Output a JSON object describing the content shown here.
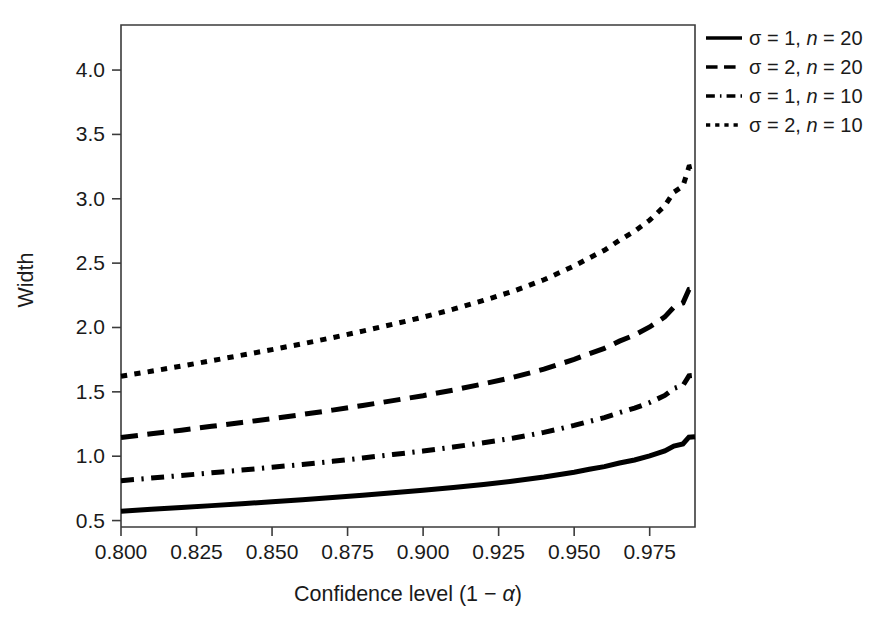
{
  "chart_data": {
    "type": "line",
    "title": "",
    "subtitle": "",
    "xlabel_parts": {
      "pre": "Confidence level (1 ",
      "minus": "−",
      "alpha": "α",
      "post": ")"
    },
    "xlabel": "Confidence level (1 − α)",
    "ylabel": "Width",
    "xlim": [
      0.8,
      0.99
    ],
    "ylim": [
      0.45,
      4.35
    ],
    "grid": false,
    "legend_position": "outside-top-right",
    "xticks": [
      0.8,
      0.825,
      0.85,
      0.875,
      0.9,
      0.925,
      0.95,
      0.975
    ],
    "xticklabels": [
      "0.800",
      "0.825",
      "0.850",
      "0.875",
      "0.900",
      "0.925",
      "0.950",
      "0.975"
    ],
    "yticks": [
      0.5,
      1.0,
      1.5,
      2.0,
      2.5,
      3.0,
      3.5,
      4.0
    ],
    "yticklabels": [
      "0.5",
      "1.0",
      "1.5",
      "2.0",
      "2.5",
      "3.0",
      "3.5",
      "4.0"
    ],
    "x": [
      0.8,
      0.81,
      0.82,
      0.83,
      0.84,
      0.85,
      0.86,
      0.87,
      0.88,
      0.89,
      0.9,
      0.91,
      0.92,
      0.93,
      0.94,
      0.95,
      0.955,
      0.96,
      0.965,
      0.97,
      0.975,
      0.98,
      0.983,
      0.986,
      0.988,
      0.99
    ],
    "series": [
      {
        "name": "σ = 1, n = 20",
        "sigma": 1,
        "n": 20,
        "dash": "solid",
        "color": "#000000",
        "linewidth": 5.0,
        "values": [
          0.573,
          0.587,
          0.601,
          0.616,
          0.631,
          0.646,
          0.662,
          0.679,
          0.697,
          0.716,
          0.735,
          0.757,
          0.781,
          0.807,
          0.838,
          0.876,
          0.898,
          0.919,
          0.947,
          0.971,
          1.002,
          1.041,
          1.079,
          1.095,
          1.148,
          1.152
        ]
      },
      {
        "name": "σ = 2, n = 20",
        "sigma": 2,
        "n": 20,
        "dash": "dashed",
        "color": "#000000",
        "linewidth": 5.0,
        "values": [
          1.146,
          1.174,
          1.202,
          1.232,
          1.262,
          1.292,
          1.324,
          1.358,
          1.394,
          1.432,
          1.47,
          1.514,
          1.562,
          1.614,
          1.676,
          1.752,
          1.796,
          1.838,
          1.894,
          1.942,
          2.004,
          2.082,
          2.158,
          2.19,
          2.296,
          2.304
        ]
      },
      {
        "name": "σ = 1, n = 10",
        "sigma": 1,
        "n": 10,
        "dash": "dashdot",
        "color": "#000000",
        "linewidth": 5.0,
        "values": [
          0.81,
          0.83,
          0.85,
          0.871,
          0.892,
          0.914,
          0.936,
          0.96,
          0.986,
          1.013,
          1.04,
          1.071,
          1.105,
          1.141,
          1.185,
          1.239,
          1.27,
          1.3,
          1.339,
          1.373,
          1.417,
          1.472,
          1.526,
          1.549,
          1.624,
          1.629
        ]
      },
      {
        "name": "σ = 2, n = 10",
        "sigma": 2,
        "n": 10,
        "dash": "dotted",
        "color": "#000000",
        "linewidth": 5.0,
        "values": [
          1.621,
          1.66,
          1.7,
          1.742,
          1.785,
          1.828,
          1.873,
          1.921,
          1.972,
          2.025,
          2.08,
          2.142,
          2.21,
          2.283,
          2.371,
          2.478,
          2.54,
          2.6,
          2.678,
          2.747,
          2.834,
          2.945,
          3.052,
          3.098,
          3.247,
          3.258
        ]
      }
    ],
    "legend": [
      {
        "label_sigma": "σ",
        "label_eq1": " = 1, ",
        "label_n": "n",
        "label_eq2": " = 20",
        "dash": "solid"
      },
      {
        "label_sigma": "σ",
        "label_eq1": " = 2, ",
        "label_n": "n",
        "label_eq2": " = 20",
        "dash": "dashed"
      },
      {
        "label_sigma": "σ",
        "label_eq1": " = 1, ",
        "label_n": "n",
        "label_eq2": " = 10",
        "dash": "dashdot"
      },
      {
        "label_sigma": "σ",
        "label_eq1": " = 2, ",
        "label_n": "n",
        "label_eq2": " = 10",
        "dash": "dotted"
      }
    ],
    "background_color": "#ffffff",
    "axis_color": "#3b3b3b"
  }
}
